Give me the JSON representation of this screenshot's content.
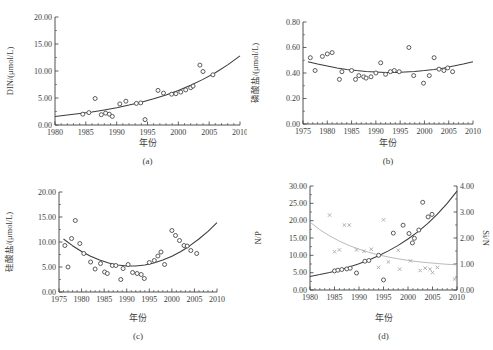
{
  "figure": {
    "background": "#ffffff",
    "ink_color": "#3c3c3c",
    "secondary_color": "#a8a8a8",
    "marker_color": "#4a4a4a"
  },
  "chart_data": [
    {
      "id": "a",
      "type": "scatter",
      "caption": "(a)",
      "xlabel": "年份",
      "ylabel": "DIN/(μmol/L)",
      "xlim": [
        1980,
        2010
      ],
      "xticks": [
        1980,
        1985,
        1990,
        1995,
        2000,
        2005,
        2010
      ],
      "xminor_step": 1,
      "ylim": [
        0,
        20
      ],
      "yticks": [
        0,
        5,
        10,
        15,
        20
      ],
      "ytick_labels": [
        "0.00",
        "5.00",
        "10.00",
        "15.00",
        "20.00"
      ],
      "yminor_step": 2.5,
      "grid": false,
      "series": [
        {
          "name": "DIN",
          "marker": "circle",
          "axis": "left",
          "points": [
            [
              1984.5,
              2.0
            ],
            [
              1985.5,
              2.3
            ],
            [
              1986.5,
              4.9
            ],
            [
              1987.5,
              1.9
            ],
            [
              1988.2,
              2.2
            ],
            [
              1988.8,
              2.0
            ],
            [
              1989.3,
              1.6
            ],
            [
              1990.5,
              3.9
            ],
            [
              1991.5,
              4.4
            ],
            [
              1993.2,
              4.0
            ],
            [
              1993.9,
              4.1
            ],
            [
              1994.6,
              1.0
            ],
            [
              1996.7,
              6.4
            ],
            [
              1997.6,
              5.9
            ],
            [
              1998.9,
              5.7
            ],
            [
              1999.6,
              5.8
            ],
            [
              2000.4,
              6.1
            ],
            [
              2001.2,
              6.5
            ],
            [
              2002.0,
              6.9
            ],
            [
              2002.4,
              7.2
            ],
            [
              2003.5,
              11.1
            ],
            [
              2004.0,
              9.9
            ],
            [
              2005.6,
              9.3
            ]
          ],
          "fit_curve": [
            [
              1980,
              1.6
            ],
            [
              1982,
              1.84
            ],
            [
              1984,
              2.11
            ],
            [
              1986,
              2.43
            ],
            [
              1988,
              2.79
            ],
            [
              1990,
              3.2
            ],
            [
              1992,
              3.68
            ],
            [
              1994,
              4.22
            ],
            [
              1996,
              4.85
            ],
            [
              1998,
              5.57
            ],
            [
              2000,
              6.4
            ],
            [
              2002,
              7.35
            ],
            [
              2004,
              8.44
            ],
            [
              2006,
              9.69
            ],
            [
              2008,
              11.13
            ],
            [
              2010,
              12.79
            ]
          ]
        }
      ]
    },
    {
      "id": "b",
      "type": "scatter",
      "caption": "(b)",
      "xlabel": "年份",
      "ylabel": "磷酸盐/(μmol/L)",
      "xlim": [
        1975,
        2010
      ],
      "xticks": [
        1975,
        1980,
        1985,
        1990,
        1995,
        2000,
        2005,
        2010
      ],
      "xminor_step": 1,
      "ylim": [
        0,
        0.8
      ],
      "yticks": [
        0,
        0.2,
        0.4,
        0.6,
        0.8
      ],
      "ytick_labels": [
        "0.00",
        "0.20",
        "0.40",
        "0.60",
        "0.80"
      ],
      "yminor_step": 0.1,
      "grid": false,
      "series": [
        {
          "name": "磷酸盐",
          "marker": "circle",
          "axis": "left",
          "points": [
            [
              1976.5,
              0.52
            ],
            [
              1977.5,
              0.42
            ],
            [
              1979.0,
              0.53
            ],
            [
              1980.0,
              0.55
            ],
            [
              1981.0,
              0.56
            ],
            [
              1982.5,
              0.35
            ],
            [
              1983.0,
              0.41
            ],
            [
              1985.0,
              0.42
            ],
            [
              1985.8,
              0.35
            ],
            [
              1986.5,
              0.38
            ],
            [
              1987.5,
              0.37
            ],
            [
              1988.0,
              0.36
            ],
            [
              1989.0,
              0.37
            ],
            [
              1990.0,
              0.4
            ],
            [
              1991.0,
              0.48
            ],
            [
              1992.0,
              0.39
            ],
            [
              1993.0,
              0.41
            ],
            [
              1993.8,
              0.42
            ],
            [
              1994.8,
              0.41
            ],
            [
              1996.8,
              0.6
            ],
            [
              1997.8,
              0.38
            ],
            [
              1999.8,
              0.32
            ],
            [
              2001.0,
              0.38
            ],
            [
              2002.0,
              0.52
            ],
            [
              2003.0,
              0.43
            ],
            [
              2004.0,
              0.42
            ],
            [
              2004.8,
              0.44
            ],
            [
              2005.8,
              0.41
            ]
          ],
          "fit_curve": [
            [
              1976,
              0.489
            ],
            [
              1978,
              0.47
            ],
            [
              1980,
              0.454
            ],
            [
              1982,
              0.44
            ],
            [
              1984,
              0.428
            ],
            [
              1986,
              0.419
            ],
            [
              1988,
              0.412
            ],
            [
              1990,
              0.408
            ],
            [
              1992,
              0.405
            ],
            [
              1994,
              0.405
            ],
            [
              1996,
              0.408
            ],
            [
              1998,
              0.412
            ],
            [
              2000,
              0.419
            ],
            [
              2002,
              0.428
            ],
            [
              2004,
              0.44
            ],
            [
              2006,
              0.454
            ],
            [
              2008,
              0.47
            ],
            [
              2010,
              0.489
            ]
          ]
        }
      ]
    },
    {
      "id": "c",
      "type": "scatter",
      "caption": "(c)",
      "xlabel": "年份",
      "ylabel": "硅酸盐/(μmol/L)",
      "xlim": [
        1975,
        2010
      ],
      "xticks": [
        1975,
        1980,
        1985,
        1990,
        1995,
        2000,
        2005,
        2010
      ],
      "xminor_step": 1,
      "ylim": [
        0,
        20
      ],
      "yticks": [
        0,
        5,
        10,
        15,
        20
      ],
      "ytick_labels": [
        "0.00",
        "5.00",
        "10.00",
        "15.00",
        "20.00"
      ],
      "yminor_step": 2.5,
      "grid": false,
      "series": [
        {
          "name": "硅酸盐",
          "marker": "circle",
          "axis": "left",
          "points": [
            [
              1976.3,
              9.3
            ],
            [
              1977.0,
              5.0
            ],
            [
              1977.8,
              10.7
            ],
            [
              1978.6,
              14.3
            ],
            [
              1979.6,
              9.7
            ],
            [
              1980.5,
              7.7
            ],
            [
              1982.0,
              6.0
            ],
            [
              1983.0,
              4.6
            ],
            [
              1984.2,
              5.7
            ],
            [
              1985.1,
              4.0
            ],
            [
              1985.7,
              3.7
            ],
            [
              1986.8,
              5.3
            ],
            [
              1987.6,
              5.3
            ],
            [
              1988.7,
              2.5
            ],
            [
              1989.2,
              4.7
            ],
            [
              1990.3,
              5.5
            ],
            [
              1991.3,
              3.9
            ],
            [
              1992.3,
              3.7
            ],
            [
              1993.2,
              3.5
            ],
            [
              1993.9,
              2.7
            ],
            [
              1995.0,
              5.9
            ],
            [
              1996.1,
              6.3
            ],
            [
              1996.9,
              7.2
            ],
            [
              1997.6,
              8.0
            ],
            [
              1998.4,
              5.5
            ],
            [
              2000.0,
              12.3
            ],
            [
              2000.8,
              11.3
            ],
            [
              2001.7,
              10.3
            ],
            [
              2002.7,
              9.3
            ],
            [
              2003.4,
              9.2
            ],
            [
              2004.2,
              8.3
            ],
            [
              2005.5,
              7.7
            ]
          ],
          "fit_curve": [
            [
              1976,
              10.6
            ],
            [
              1978,
              9.26
            ],
            [
              1980,
              8.1
            ],
            [
              1982,
              7.14
            ],
            [
              1984,
              6.38
            ],
            [
              1986,
              5.8
            ],
            [
              1988,
              5.42
            ],
            [
              1990,
              5.22
            ],
            [
              1992,
              5.22
            ],
            [
              1994,
              5.42
            ],
            [
              1996,
              5.8
            ],
            [
              1998,
              6.38
            ],
            [
              2000,
              7.14
            ],
            [
              2002,
              8.1
            ],
            [
              2004,
              9.26
            ],
            [
              2006,
              10.6
            ],
            [
              2008,
              12.13
            ],
            [
              2010,
              13.86
            ]
          ]
        }
      ]
    },
    {
      "id": "d",
      "type": "scatter",
      "caption": "(d)",
      "xlabel": "年份",
      "ylabel": "N/P",
      "y2label": "Si/N",
      "xlim": [
        1980,
        2010
      ],
      "xticks": [
        1980,
        1985,
        1990,
        1995,
        2000,
        2005,
        2010
      ],
      "xminor_step": 1,
      "ylim": [
        0,
        30
      ],
      "yticks": [
        0,
        5,
        10,
        15,
        20,
        25,
        30
      ],
      "ytick_labels": [
        "0.00",
        "5.00",
        "10.00",
        "15.00",
        "20.00",
        "25.00",
        "30.00"
      ],
      "yminor_step": 2.5,
      "y2lim": [
        0,
        4
      ],
      "y2ticks": [
        0,
        1,
        2,
        3,
        4
      ],
      "y2tick_labels": [
        "0.00",
        "1.00",
        "2.00",
        "3.00",
        "4.00"
      ],
      "y2minor_step": 0.5,
      "grid": false,
      "series": [
        {
          "name": "N/P",
          "marker": "circle",
          "axis": "left",
          "points": [
            [
              1985.0,
              5.5
            ],
            [
              1985.7,
              5.7
            ],
            [
              1986.5,
              5.9
            ],
            [
              1987.5,
              6.1
            ],
            [
              1988.2,
              6.3
            ],
            [
              1989.5,
              4.9
            ],
            [
              1991.2,
              8.3
            ],
            [
              1992.0,
              8.5
            ],
            [
              1994.0,
              10.0
            ],
            [
              1995.0,
              2.9
            ],
            [
              1997.0,
              16.4
            ],
            [
              1999.0,
              18.7
            ],
            [
              2000.2,
              16.3
            ],
            [
              2000.9,
              13.6
            ],
            [
              2001.3,
              14.9
            ],
            [
              2002.2,
              17.3
            ],
            [
              2003.0,
              25.3
            ],
            [
              2004.1,
              21.1
            ],
            [
              2004.9,
              21.8
            ]
          ],
          "fit_curve": [
            [
              1980,
              3.9
            ],
            [
              1982,
              4.45
            ],
            [
              1984,
              5.08
            ],
            [
              1986,
              5.8
            ],
            [
              1988,
              6.63
            ],
            [
              1990,
              7.57
            ],
            [
              1992,
              8.64
            ],
            [
              1994,
              9.87
            ],
            [
              1996,
              11.27
            ],
            [
              1998,
              12.87
            ],
            [
              2000,
              14.7
            ],
            [
              2002,
              16.78
            ],
            [
              2004,
              19.16
            ],
            [
              2006,
              21.88
            ],
            [
              2008,
              24.98
            ],
            [
              2010,
              28.53
            ]
          ]
        },
        {
          "name": "Si/N",
          "marker": "x",
          "axis": "right",
          "points": [
            [
              1984.0,
              2.88
            ],
            [
              1985.0,
              1.47
            ],
            [
              1986.0,
              1.54
            ],
            [
              1987.0,
              2.5
            ],
            [
              1988.0,
              2.5
            ],
            [
              1989.5,
              1.54
            ],
            [
              1991.0,
              1.49
            ],
            [
              1992.5,
              1.57
            ],
            [
              1994.0,
              0.87
            ],
            [
              1995.0,
              2.7
            ],
            [
              1996.0,
              1.08
            ],
            [
              1998.0,
              1.53
            ],
            [
              1998.3,
              0.8
            ],
            [
              2000.5,
              1.12
            ],
            [
              2002.5,
              0.75
            ],
            [
              2003.5,
              0.84
            ],
            [
              2004.5,
              0.8
            ],
            [
              2005.0,
              0.67
            ],
            [
              2006.0,
              0.87
            ],
            [
              2009.5,
              0.42
            ]
          ],
          "fit_curve": [
            [
              1980,
              2.61
            ],
            [
              1982,
              2.32
            ],
            [
              1984,
              2.08
            ],
            [
              1986,
              1.88
            ],
            [
              1988,
              1.71
            ],
            [
              1990,
              1.57
            ],
            [
              1992,
              1.45
            ],
            [
              1994,
              1.35
            ],
            [
              1996,
              1.27
            ],
            [
              1998,
              1.2
            ],
            [
              2000,
              1.14
            ],
            [
              2002,
              1.09
            ],
            [
              2004,
              1.05
            ],
            [
              2006,
              1.02
            ],
            [
              2008,
              0.99
            ],
            [
              2010,
              0.97
            ]
          ]
        }
      ]
    }
  ]
}
